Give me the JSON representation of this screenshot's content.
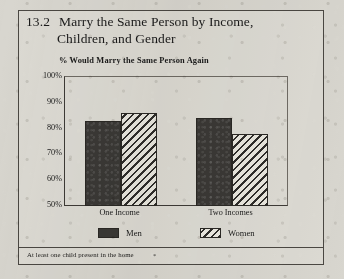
{
  "figure": {
    "number": "13.2",
    "title_line1": "Marry the Same Person by Income,",
    "title_line2": "Children, and Gender",
    "subtitle": "% Would Marry the Same Person Again",
    "footnote": "At least one child present in the home",
    "footnote_marker": "*",
    "frame_color": "#4a4742",
    "paper_color": "#d8d6cf"
  },
  "chart_data": {
    "type": "bar",
    "subtitle": "% Would Marry the Same Person Again",
    "xlabel": "",
    "ylabel": "% Would Marry the Same Person Again",
    "categories": [
      "One Income",
      "Two Incomes"
    ],
    "series": [
      {
        "name": "Men",
        "values": [
          83,
          84
        ],
        "color": "#3a3835",
        "fill": "solid"
      },
      {
        "name": "Women",
        "values": [
          86,
          78
        ],
        "color": "#2f2d2a",
        "fill": "diagonal-hatch"
      }
    ],
    "ylim": [
      50,
      100
    ],
    "yticks": [
      50,
      60,
      70,
      80,
      90,
      100
    ],
    "ytick_labels": [
      "50%",
      "60%",
      "70%",
      "80%",
      "90%",
      "100%"
    ],
    "grid": false,
    "legend_position": "bottom",
    "value_suffix": "%"
  }
}
